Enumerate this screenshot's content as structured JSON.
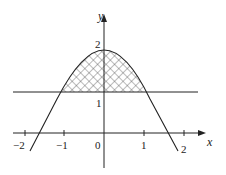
{
  "figure": {
    "axes": {
      "x_label": "x",
      "y_label": "y",
      "origin_label": "0",
      "x_ticks": [
        "−2",
        "−1",
        "1",
        "2"
      ],
      "y_ticks": [
        "1",
        "2"
      ]
    },
    "curve": {
      "peak": [
        0,
        2
      ],
      "crosses_line_at": [
        -1,
        1
      ]
    },
    "horizontal_line": {
      "y": 1
    },
    "shaded_region": "between curve and y=1, for -1 ≤ x ≤ 1",
    "colors": {
      "stroke": "#222222",
      "hatch": "#555555",
      "background": "#ffffff"
    }
  }
}
